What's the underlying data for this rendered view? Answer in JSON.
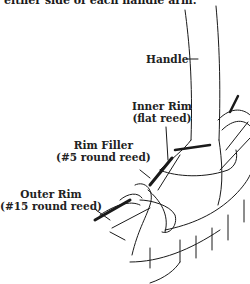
{
  "caption": "either side of each handle arm.",
  "labels": {
    "handle": "Handle",
    "inner_rim_line1": "Inner Rim",
    "inner_rim_line2": "(flat reed)",
    "rim_filler_line1": "Rim Filler",
    "rim_filler_line2": "(#5 round reed)",
    "outer_rim_line1": "Outer Rim",
    "outer_rim_line2": "(#15 round reed)"
  },
  "colors": {
    "line": "#1a1a1a",
    "background": "#ffffff"
  }
}
